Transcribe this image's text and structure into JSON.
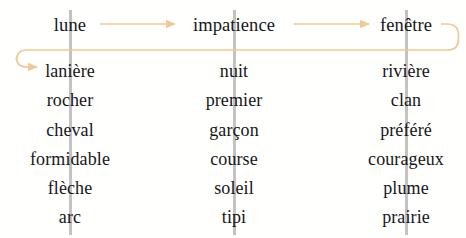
{
  "canvas": {
    "width": 466,
    "height": 238,
    "background": "#fffffe"
  },
  "style": {
    "text_color": "#16161a",
    "arrow_color": "#f2c897",
    "guide_color": "#b8b8b8"
  },
  "columns": [
    {
      "name": "column-1",
      "center_x": 70,
      "guide_x": 69
    },
    {
      "name": "column-2",
      "center_x": 234,
      "guide_x": 233
    },
    {
      "name": "column-3",
      "center_x": 406,
      "guide_x": 405
    }
  ],
  "rows": [
    {
      "name": "row-1",
      "center_y": 25,
      "is_header": true
    },
    {
      "name": "row-2",
      "center_y": 71,
      "is_header": false
    },
    {
      "name": "row-3",
      "center_y": 100,
      "is_header": false
    },
    {
      "name": "row-4",
      "center_y": 130,
      "is_header": false
    },
    {
      "name": "row-5",
      "center_y": 159,
      "is_header": false
    },
    {
      "name": "row-6",
      "center_y": 188,
      "is_header": false
    },
    {
      "name": "row-7",
      "center_y": 217,
      "is_header": false
    }
  ],
  "grid": {
    "row_1": {
      "col_1": "lune",
      "col_2": "impatience",
      "col_3": "fenêtre"
    },
    "row_2": {
      "col_1": "lanière",
      "col_2": "nuit",
      "col_3": "rivière"
    },
    "row_3": {
      "col_1": "rocher",
      "col_2": "premier",
      "col_3": "clan"
    },
    "row_4": {
      "col_1": "cheval",
      "col_2": "garçon",
      "col_3": "préféré"
    },
    "row_5": {
      "col_1": "formidable",
      "col_2": "course",
      "col_3": "courageux"
    },
    "row_6": {
      "col_1": "flèche",
      "col_2": "soleil",
      "col_3": "plume"
    },
    "row_7": {
      "col_1": "arc",
      "col_2": "tipi",
      "col_3": "prairie"
    }
  },
  "connectors": [
    {
      "name": "arrow-lune-to-impatience",
      "from": "lune",
      "to": "impatience",
      "kind": "straight",
      "x1": 100,
      "y1": 24,
      "x2": 175,
      "y2": 24
    },
    {
      "name": "arrow-impatience-to-fenetre",
      "from": "impatience",
      "to": "fenêtre",
      "kind": "straight",
      "x1": 294,
      "y1": 24,
      "x2": 369,
      "y2": 24
    },
    {
      "name": "arrow-fenetre-wrap-to-laniere",
      "from": "fenêtre",
      "to": "lanière",
      "kind": "wrap-around",
      "path": "M 441 24 L 448 24 Q 459 24 459 35 L 459 40 Q 459 50 449 50 L 27 50 Q 17 50 17 60 L 17 58 Q 17 67 27 67 L 38 67"
    }
  ]
}
